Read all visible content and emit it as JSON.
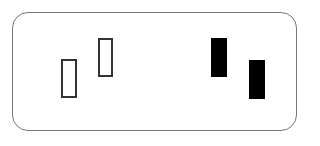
{
  "diagram": {
    "type": "candlestick-pattern",
    "frame": {
      "x": 12,
      "y": 12,
      "width": 285,
      "height": 119,
      "border_color": "#777777"
    },
    "bars": [
      {
        "name": "hollow-bar-1",
        "style": "hollow",
        "x": 61,
        "y": 59,
        "width": 16,
        "height": 39
      },
      {
        "name": "hollow-bar-2",
        "style": "hollow",
        "x": 98,
        "y": 38,
        "width": 15,
        "height": 39
      },
      {
        "name": "filled-bar-1",
        "style": "filled",
        "x": 211,
        "y": 38,
        "width": 16,
        "height": 39
      },
      {
        "name": "filled-bar-2",
        "style": "filled",
        "x": 249,
        "y": 60,
        "width": 16,
        "height": 39
      }
    ],
    "colors": {
      "hollow_border": "#333333",
      "filled": "#000000",
      "background": "#ffffff"
    }
  }
}
